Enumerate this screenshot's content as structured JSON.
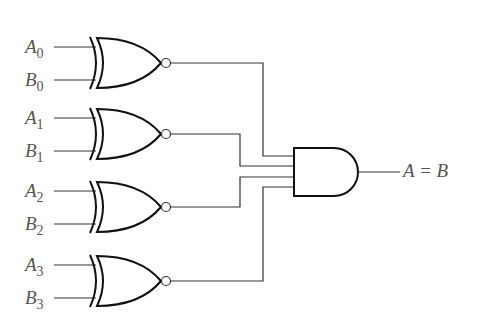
{
  "diagram": {
    "type": "4-bit equality comparator",
    "gates": [
      {
        "kind": "XNOR",
        "inputs": [
          {
            "name": "A",
            "sub": "0"
          },
          {
            "name": "B",
            "sub": "0"
          }
        ],
        "y": 63
      },
      {
        "kind": "XNOR",
        "inputs": [
          {
            "name": "A",
            "sub": "1"
          },
          {
            "name": "B",
            "sub": "1"
          }
        ],
        "y": 134
      },
      {
        "kind": "XNOR",
        "inputs": [
          {
            "name": "A",
            "sub": "2"
          },
          {
            "name": "B",
            "sub": "2"
          }
        ],
        "y": 207
      },
      {
        "kind": "XNOR",
        "inputs": [
          {
            "name": "A",
            "sub": "3"
          },
          {
            "name": "B",
            "sub": "3"
          }
        ],
        "y": 281
      }
    ],
    "and_gate": {
      "kind": "AND",
      "inputs": 4
    },
    "output_label": "A = B",
    "colors": {
      "line": "#222222",
      "text": "#555555"
    }
  },
  "labels": {
    "a0": "A",
    "a0_sub": "0",
    "b0": "B",
    "b0_sub": "0",
    "a1": "A",
    "a1_sub": "1",
    "b1": "B",
    "b1_sub": "1",
    "a2": "A",
    "a2_sub": "2",
    "b2": "B",
    "b2_sub": "2",
    "a3": "A",
    "a3_sub": "3",
    "b3": "B",
    "b3_sub": "3",
    "output": "A = B"
  }
}
